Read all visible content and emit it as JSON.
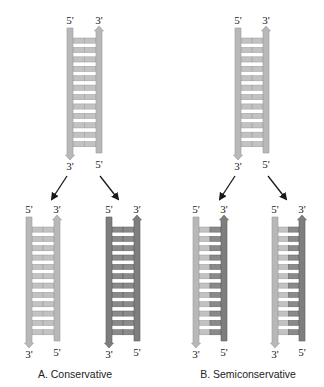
{
  "colors": {
    "light_strand": "#b8b8b8",
    "light_strand_edge": "#9a9a9a",
    "dark_strand": "#7e7e7e",
    "dark_strand_edge": "#5e5e5e",
    "light_rung": "#c2c2c2",
    "dark_rung": "#8a8a8a",
    "arrow": "#1a1a1a",
    "text": "#222222"
  },
  "labels": {
    "five_prime": "5'",
    "three_prime": "3'"
  },
  "panels": [
    {
      "caption": "A. Conservative",
      "parent": {
        "left_x": 67,
        "right_x": 96,
        "top": 28,
        "bottom": 155,
        "rungs": 12,
        "left_shade": "light",
        "right_shade": "light",
        "rung_shade": [
          "light",
          "light"
        ]
      },
      "daughters": [
        {
          "left_x": 26,
          "right_x": 54,
          "left_shade": "light",
          "right_shade": "light",
          "rung_shade": [
            "light",
            "light"
          ]
        },
        {
          "left_x": 106,
          "right_x": 134,
          "left_shade": "dark",
          "right_shade": "dark",
          "rung_shade": [
            "dark",
            "dark"
          ]
        }
      ],
      "arrows": [
        {
          "x1": 67,
          "y1": 176,
          "x2": 52,
          "y2": 199
        },
        {
          "x1": 100,
          "y1": 176,
          "x2": 118,
          "y2": 199
        }
      ]
    },
    {
      "caption": "B. Semiconservative",
      "parent": {
        "left_x": 235,
        "right_x": 263,
        "top": 28,
        "bottom": 155,
        "rungs": 12,
        "left_shade": "light",
        "right_shade": "light",
        "rung_shade": [
          "light",
          "light"
        ]
      },
      "daughters": [
        {
          "left_x": 193,
          "right_x": 221,
          "left_shade": "light",
          "right_shade": "dark",
          "rung_shade": [
            "light",
            "dark"
          ]
        },
        {
          "left_x": 272,
          "right_x": 299,
          "left_shade": "light",
          "right_shade": "dark",
          "rung_shade": [
            "light",
            "dark"
          ]
        }
      ],
      "arrows": [
        {
          "x1": 235,
          "y1": 176,
          "x2": 220,
          "y2": 199
        },
        {
          "x1": 268,
          "y1": 176,
          "x2": 286,
          "y2": 199
        }
      ]
    }
  ],
  "daughter_geometry": {
    "top": 217,
    "bottom": 343,
    "rungs": 12
  }
}
